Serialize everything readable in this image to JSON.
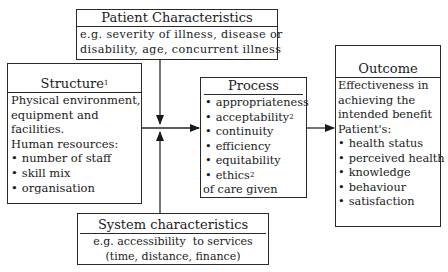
{
  "diagram": {
    "patient": {
      "title": "Patient Characteristics",
      "lines": [
        "e.g. severity of illness, disease or",
        "disability, age, concurrent illness"
      ]
    },
    "structure": {
      "title": "Structure",
      "title_sup": "1",
      "lines": [
        "Physical environment,",
        "equipment and",
        "facilities.",
        "Human resources:"
      ],
      "bullets": [
        "number of staff",
        "skill mix",
        "organisation"
      ]
    },
    "process": {
      "title": "Process",
      "bullets": [
        {
          "text": "appropriateness",
          "sup": ""
        },
        {
          "text": "acceptability",
          "sup": "2"
        },
        {
          "text": "continuity",
          "sup": ""
        },
        {
          "text": "efficiency",
          "sup": ""
        },
        {
          "text": "equitability",
          "sup": ""
        },
        {
          "text": "ethics",
          "sup": "2"
        }
      ],
      "footer": "of care given"
    },
    "outcome": {
      "title": "Outcome",
      "lines": [
        "Effectiveness in",
        "achieving the",
        "intended benefit",
        "Patient's:"
      ],
      "bullets": [
        "health status",
        "perceived health",
        "knowledge",
        "behaviour",
        "satisfaction"
      ]
    },
    "system": {
      "title": "System characteristics",
      "lines": [
        "e.g. accessibility  to services",
        "(time, distance, finance)"
      ]
    },
    "colors": {
      "line": "#2a2a2a",
      "background": "#ffffff"
    }
  }
}
